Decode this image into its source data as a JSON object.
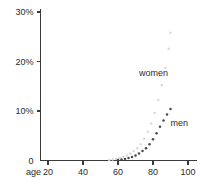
{
  "chart_data": {
    "type": "scatter",
    "title": "",
    "subtitle": "",
    "xlabel": "age",
    "ylabel": "",
    "xlim": [
      10,
      105
    ],
    "ylim": [
      0,
      31
    ],
    "grid": false,
    "legend_position": "inline-annotation",
    "x_ticks": [
      {
        "value": 20,
        "label": "20"
      },
      {
        "value": 40,
        "label": "40"
      },
      {
        "value": 60,
        "label": "60"
      },
      {
        "value": 80,
        "label": "80"
      },
      {
        "value": 100,
        "label": "100"
      }
    ],
    "y_ticks": [
      {
        "value": 0,
        "label": "0"
      },
      {
        "value": 10,
        "label": "10%"
      },
      {
        "value": 20,
        "label": "20%"
      },
      {
        "value": 30,
        "label": "30%"
      }
    ],
    "series": [
      {
        "name": "women",
        "color": "#d9d9d9",
        "marker": "dot",
        "annotation": "women",
        "annotation_x": 72,
        "annotation_y": 17.0,
        "x": [
          55,
          57,
          59,
          61,
          63,
          65,
          67,
          69,
          71,
          73,
          75,
          77,
          79,
          81,
          83,
          85,
          87,
          89,
          90
        ],
        "y": [
          0.1,
          0.2,
          0.3,
          0.5,
          0.7,
          1.0,
          1.4,
          1.9,
          2.5,
          3.3,
          4.4,
          5.8,
          7.5,
          9.6,
          12.2,
          15.2,
          18.7,
          22.6,
          25.8
        ]
      },
      {
        "name": "men",
        "color": "#4a4a4a",
        "marker": "dot",
        "annotation": "men",
        "annotation_x": 90,
        "annotation_y": 7.0,
        "x": [
          60,
          62,
          64,
          66,
          68,
          70,
          72,
          74,
          76,
          78,
          80,
          82,
          84,
          86,
          88,
          90
        ],
        "y": [
          0.1,
          0.2,
          0.3,
          0.5,
          0.7,
          1.0,
          1.4,
          1.9,
          2.5,
          3.3,
          4.3,
          5.5,
          6.8,
          8.1,
          9.3,
          10.4
        ]
      }
    ]
  },
  "axes": {
    "x_label": "age",
    "y_label": ""
  },
  "colors": {
    "axis": "#3a3a3a",
    "text": "#2b2b2b",
    "women": "#d9d9d9",
    "men": "#4a4a4a",
    "background": "#ffffff"
  }
}
